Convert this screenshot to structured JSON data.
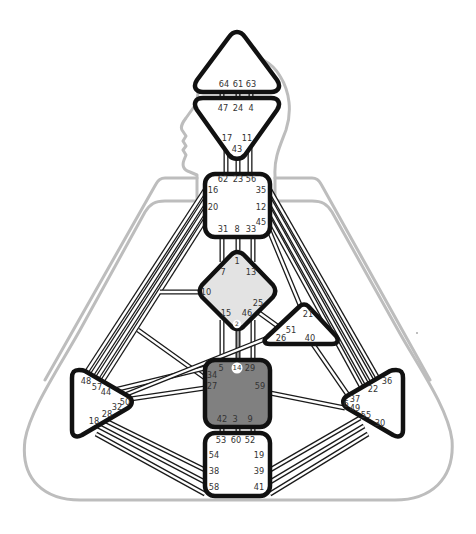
{
  "chart_title": "Human Design Bodygraph",
  "colors": {
    "outline": "#111111",
    "body_silhouette": "#bdbdbd",
    "defined_center": "#808080",
    "partial_center": "#e3e3e3",
    "open_center": "#ffffff",
    "active_channel": "#9a9a9a",
    "gate_text": "#333333"
  },
  "centers": [
    {
      "name": "Head",
      "state": "open",
      "gates": [
        "64",
        "61",
        "63"
      ]
    },
    {
      "name": "Ajna",
      "state": "open",
      "gates": [
        "47",
        "24",
        "4",
        "17",
        "43",
        "11"
      ]
    },
    {
      "name": "Throat",
      "state": "open",
      "gates": [
        "62",
        "23",
        "56",
        "16",
        "35",
        "20",
        "12",
        "45",
        "31",
        "8",
        "33"
      ]
    },
    {
      "name": "G",
      "state": "partial",
      "gates": [
        "1",
        "7",
        "13",
        "10",
        "25",
        "15",
        "46",
        "2"
      ]
    },
    {
      "name": "Heart",
      "state": "open",
      "gates": [
        "21",
        "51",
        "26",
        "40"
      ]
    },
    {
      "name": "Spleen",
      "state": "open",
      "gates": [
        "48",
        "57",
        "44",
        "50",
        "32",
        "28",
        "18"
      ]
    },
    {
      "name": "Sacral",
      "state": "defined",
      "gates": [
        "5",
        "14",
        "29",
        "34",
        "27",
        "59",
        "42",
        "3",
        "9"
      ]
    },
    {
      "name": "Solar Plexus",
      "state": "open",
      "gates": [
        "36",
        "22",
        "37",
        "6",
        "49",
        "55",
        "30"
      ]
    },
    {
      "name": "Root",
      "state": "open",
      "gates": [
        "53",
        "60",
        "52",
        "54",
        "19",
        "38",
        "39",
        "58",
        "41"
      ]
    }
  ],
  "highlighted_gates": [
    "2",
    "14"
  ],
  "active_channels": [
    {
      "from": "2",
      "to": "14",
      "name": "Channel 2-14"
    }
  ],
  "labels": {
    "head": {
      "g64": "64",
      "g61": "61",
      "g63": "63"
    },
    "ajna": {
      "g47": "47",
      "g24": "24",
      "g4": "4",
      "g17": "17",
      "g11": "11",
      "g43": "43"
    },
    "throat": {
      "g62": "62",
      "g23": "23",
      "g56": "56",
      "g16": "16",
      "g35": "35",
      "g20": "20",
      "g12": "12",
      "g45": "45",
      "g31": "31",
      "g8": "8",
      "g33": "33"
    },
    "g": {
      "g1": "1",
      "g7": "7",
      "g13": "13",
      "g10": "10",
      "g25": "25",
      "g15": "15",
      "g46": "46",
      "g2": "2"
    },
    "heart": {
      "g21": "21",
      "g51": "51",
      "g26": "26",
      "g40": "40"
    },
    "spleen": {
      "g48": "48",
      "g57": "57",
      "g44": "44",
      "g50": "50",
      "g32": "32",
      "g28": "28",
      "g18": "18"
    },
    "sacral": {
      "g5": "5",
      "g14": "14",
      "g29": "29",
      "g34": "34",
      "g27": "27",
      "g59": "59",
      "g42": "42",
      "g3": "3",
      "g9": "9"
    },
    "solar": {
      "g36": "36",
      "g22": "22",
      "g37": "37",
      "g6": "6",
      "g49": "49",
      "g55": "55",
      "g30": "30"
    },
    "root": {
      "g53": "53",
      "g60": "60",
      "g52": "52",
      "g54": "54",
      "g19": "19",
      "g38": "38",
      "g39": "39",
      "g58": "58",
      "g41": "41"
    }
  }
}
